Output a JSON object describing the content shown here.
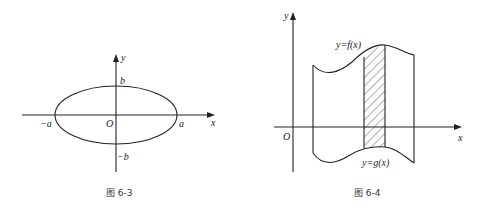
{
  "figures": [
    {
      "id": "fig-6-3",
      "caption": "图 6-3",
      "axis_labels": {
        "x": "x",
        "y": "y"
      },
      "origin_label": "O",
      "point_labels": {
        "pos_a": "a",
        "neg_a": "−a",
        "pos_b": "b",
        "neg_b": "−b"
      },
      "shape": "ellipse"
    },
    {
      "id": "fig-6-4",
      "caption": "图 6-4",
      "axis_labels": {
        "x": "x",
        "y": "y"
      },
      "origin_label": "O",
      "curve_labels": {
        "upper": "y=f(x)",
        "lower": "y=g(x)"
      },
      "shape": "region between curves with hatched strip"
    }
  ]
}
